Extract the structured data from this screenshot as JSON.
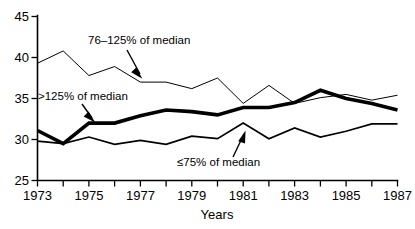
{
  "chart_data": {
    "type": "line",
    "title": "",
    "xlabel": "Years",
    "ylabel": "",
    "grid": false,
    "legend_position": "inline-annotations",
    "x": [
      1973,
      1974,
      1975,
      1976,
      1977,
      1978,
      1979,
      1980,
      1981,
      1982,
      1983,
      1984,
      1985,
      1986,
      1987
    ],
    "xlim": [
      1973,
      1987
    ],
    "ylim": [
      25,
      45
    ],
    "ytick_labels": [
      "25",
      "30",
      "35",
      "40",
      "45"
    ],
    "yticks": [
      25,
      30,
      35,
      40,
      45
    ],
    "xtick_labels": [
      "1973",
      "1975",
      "1977",
      "1979",
      "1981",
      "1983",
      "1985",
      "1987"
    ],
    "xticks_major": [
      1973,
      1975,
      1977,
      1979,
      1981,
      1983,
      1985,
      1987
    ],
    "xticks_minor": [
      1974,
      1976,
      1978,
      1980,
      1982,
      1984,
      1986
    ],
    "series": [
      {
        "name": "76–125% of median",
        "style": "thin",
        "values": [
          39.3,
          40.8,
          37.8,
          38.9,
          37.0,
          37.0,
          36.2,
          37.5,
          34.4,
          36.6,
          34.4,
          35.1,
          35.5,
          34.8,
          35.4
        ]
      },
      {
        "name": ">125% of median",
        "style": "thick",
        "values": [
          31.1,
          29.5,
          32.0,
          32.0,
          32.9,
          33.6,
          33.4,
          33.0,
          33.9,
          33.9,
          34.5,
          36.0,
          35.0,
          34.4,
          33.6
        ]
      },
      {
        "name": "≤75% of median",
        "style": "medium",
        "values": [
          29.8,
          29.5,
          30.3,
          29.4,
          29.9,
          29.4,
          30.4,
          30.1,
          32.0,
          30.1,
          31.4,
          30.3,
          31.0,
          31.9,
          31.9
        ]
      }
    ],
    "annotations": [
      {
        "text": "76–125% of median",
        "points_to_year": 1977.6,
        "points_to_value": 37.0
      },
      {
        "text": ">125% of median",
        "points_to_year": 1975.6,
        "points_to_value": 32.0
      },
      {
        "text": "≤75% of median",
        "points_to_year": 1981.0,
        "points_to_value": 32.0
      }
    ]
  },
  "labels": {
    "y0": "25",
    "y1": "30",
    "y2": "35",
    "y3": "40",
    "y4": "45",
    "x0": "1973",
    "x1": "1975",
    "x2": "1977",
    "x3": "1979",
    "x4": "1981",
    "x5": "1983",
    "x6": "1985",
    "x7": "1987",
    "x_axis_title": "Years",
    "annot_upper": "76–125% of median",
    "annot_mid": ">125% of median",
    "annot_lower": "≤75% of median"
  },
  "colors": {
    "ink": "#000000",
    "background": "#ffffff"
  }
}
